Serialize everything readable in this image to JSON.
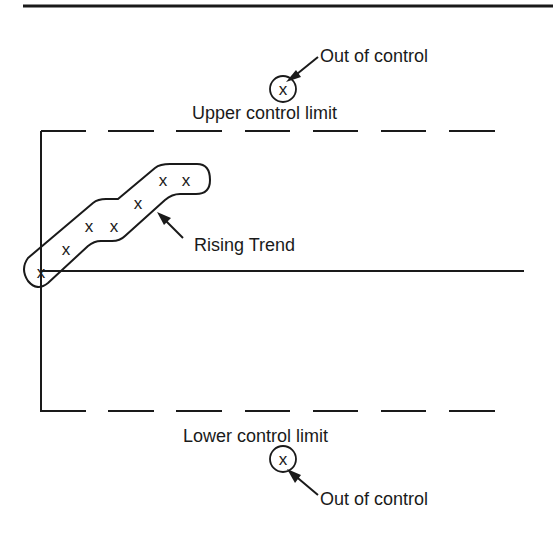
{
  "diagram": {
    "type": "control-chart-illustration",
    "labels": {
      "upper_limit": "Upper control limit",
      "lower_limit": "Lower control limit",
      "out_of_control_top": "Out of control",
      "out_of_control_bottom": "Out of control",
      "trend": "Rising Trend"
    },
    "marker_glyph": "x",
    "colors": {
      "ink": "#1a1a1a",
      "background": "#ffffff"
    },
    "trend_points": [
      {
        "x": 41,
        "y": 272
      },
      {
        "x": 66,
        "y": 249
      },
      {
        "x": 89,
        "y": 226
      },
      {
        "x": 114,
        "y": 226
      },
      {
        "x": 138,
        "y": 203
      },
      {
        "x": 163,
        "y": 180
      },
      {
        "x": 186,
        "y": 180
      }
    ]
  }
}
